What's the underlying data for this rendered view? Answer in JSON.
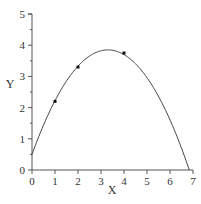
{
  "chart_data": {
    "type": "line",
    "title": "",
    "xlabel": "X",
    "ylabel": "Y",
    "xlim": [
      0,
      7
    ],
    "ylim": [
      0,
      5
    ],
    "x_ticks": [
      "0",
      "1",
      "2",
      "3",
      "4",
      "5",
      "6",
      "7"
    ],
    "y_ticks": [
      "0",
      "1",
      "2",
      "3",
      "4",
      "5"
    ],
    "grid": false,
    "legend": null,
    "series": [
      {
        "name": "fitted curve",
        "style": "line",
        "equation": "y = 0.5 + 2.03x - 0.3076x^2",
        "x": [
          0,
          0.5,
          1,
          1.5,
          2,
          2.5,
          3,
          3.3,
          3.5,
          4,
          4.5,
          5,
          5.5,
          6,
          6.5,
          6.84
        ],
        "values": [
          0.5,
          1.44,
          2.22,
          2.85,
          3.33,
          3.65,
          3.82,
          3.85,
          3.84,
          3.7,
          3.41,
          2.96,
          2.36,
          1.61,
          0.7,
          0.0
        ]
      },
      {
        "name": "data points",
        "style": "scatter",
        "x": [
          1,
          2,
          4
        ],
        "values": [
          2.2,
          3.3,
          3.75
        ]
      }
    ]
  },
  "axes": {
    "x_label": "X",
    "y_label": "Y"
  },
  "colors": {
    "line": "#444444",
    "axis": "#555555",
    "marker": "#111111"
  }
}
